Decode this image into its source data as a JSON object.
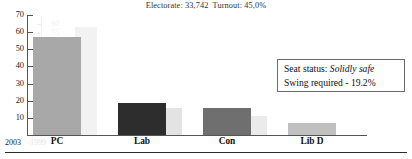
{
  "header": {
    "electorate_label": "Electorate:",
    "electorate_value": "33,742",
    "turnout_label": "Turnout:",
    "turnout_value": "45,0%",
    "full": "Electorate: 33,742  Turnout: 45,0%"
  },
  "info_box": {
    "status_label": "Seat status:",
    "status_value": "Solidly safe",
    "swing_text": "Swing required - 19.2%"
  },
  "legend": {
    "current_year": "2003",
    "previous_year": "1999"
  },
  "colors": {
    "pc": "#a8a8a8",
    "lab": "#2d2d2d",
    "con": "#6f6f6f",
    "libd": "#c0c0c0",
    "ghost_pc": "#f2f2f2",
    "ghost_lab": "#e3e3e3",
    "ghost_con": "#ebebeb",
    "ghost_libd": "#f7f7f7",
    "axis": "#555555",
    "ghost_axis": "#efefef",
    "box_border": "#6b6b6b"
  },
  "chart_data": {
    "type": "bar",
    "title": "Electorate: 33,742  Turnout: 45,0%",
    "xlabel": "",
    "ylabel": "",
    "categories": [
      "PC",
      "Lab",
      "Con",
      "Lib D"
    ],
    "ylim": [
      0,
      70
    ],
    "yticks": [
      10,
      20,
      30,
      40,
      50,
      60,
      70
    ],
    "ghost_yticks": [
      5,
      10,
      15,
      20,
      25,
      30,
      35,
      40,
      45,
      50,
      55,
      60
    ],
    "grid": false,
    "legend_position": "x-axis-left",
    "series": [
      {
        "name": "2003",
        "values": [
          57.0,
          18.5,
          16.0,
          7.0
        ],
        "colors": [
          "#a8a8a8",
          "#2d2d2d",
          "#6f6f6f",
          "#c0c0c0"
        ]
      },
      {
        "name": "1999",
        "values": [
          63.0,
          16.0,
          11.0,
          0.0
        ],
        "colors": [
          "#f2f2f2",
          "#e3e3e3",
          "#ebebeb",
          "#f7f7f7"
        ]
      }
    ],
    "annotations": [
      "Seat status: Solidly safe",
      "Swing required - 19.2%"
    ]
  }
}
